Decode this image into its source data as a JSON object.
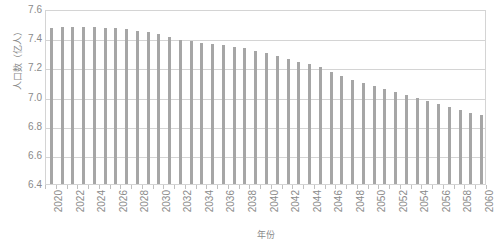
{
  "chart_data": {
    "type": "bar",
    "title": "",
    "xlabel": "年份",
    "ylabel": "人口数（亿人）",
    "ylim": [
      6.4,
      7.6
    ],
    "ytick_step": 0.2,
    "ytick_labels": [
      "7.6",
      "7.4",
      "7.2",
      "7.0",
      "6.8",
      "6.6",
      "6.4"
    ],
    "ytick_values": [
      7.6,
      7.4,
      7.2,
      7.0,
      6.8,
      6.6,
      6.4
    ],
    "grid": true,
    "legend": "none",
    "bar_color": "#a6a6a6",
    "grid_color": "#d4d4d4",
    "axis_text_color": "#8a8a8a",
    "xtick_label_step": 2,
    "xtick_labels": [
      "2020",
      "2022",
      "2024",
      "2026",
      "2028",
      "2030",
      "2032",
      "2034",
      "2036",
      "2038",
      "2040",
      "2042",
      "2044",
      "2046",
      "2048",
      "2050",
      "2052",
      "2054",
      "2056",
      "2058",
      "2060"
    ],
    "categories": [
      "2020",
      "2021",
      "2022",
      "2023",
      "2024",
      "2025",
      "2026",
      "2027",
      "2028",
      "2029",
      "2030",
      "2031",
      "2032",
      "2033",
      "2034",
      "2035",
      "2036",
      "2037",
      "2038",
      "2039",
      "2040",
      "2041",
      "2042",
      "2043",
      "2044",
      "2045",
      "2046",
      "2047",
      "2048",
      "2049",
      "2050",
      "2051",
      "2052",
      "2053",
      "2054",
      "2055",
      "2056",
      "2057",
      "2058",
      "2059",
      "2060"
    ],
    "values": [
      7.47,
      7.48,
      7.48,
      7.48,
      7.48,
      7.47,
      7.47,
      7.46,
      7.45,
      7.44,
      7.43,
      7.41,
      7.39,
      7.38,
      7.37,
      7.36,
      7.35,
      7.34,
      7.33,
      7.31,
      7.3,
      7.28,
      7.26,
      7.24,
      7.22,
      7.2,
      7.17,
      7.14,
      7.11,
      7.09,
      7.07,
      7.05,
      7.03,
      7.01,
      6.99,
      6.97,
      6.95,
      6.93,
      6.91,
      6.89,
      6.87
    ]
  }
}
